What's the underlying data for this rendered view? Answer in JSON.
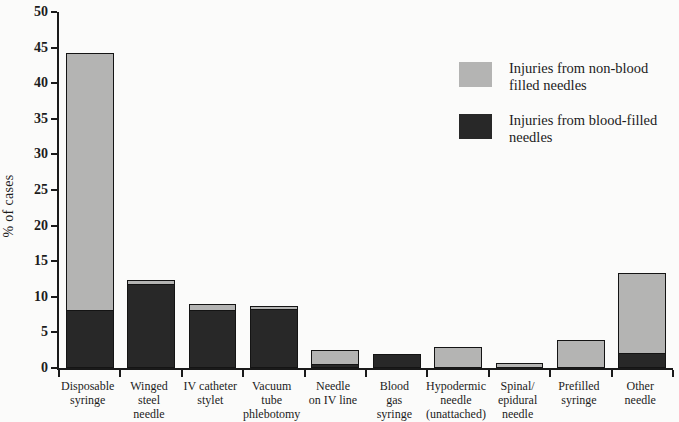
{
  "figure": {
    "background": "#fbfbfa",
    "axis_color": "#1a1a1a",
    "text_color": "#1c1c1c"
  },
  "chart_data": {
    "type": "bar",
    "stacked": true,
    "title": "",
    "xlabel": "",
    "ylabel": "% of cases",
    "ylim": [
      0,
      50
    ],
    "yticks": [
      0,
      5,
      10,
      15,
      20,
      25,
      30,
      35,
      40,
      45,
      50
    ],
    "grid": false,
    "categories": [
      "Disposable\nsyringe",
      "Winged\nsteel\nneedle",
      "IV catheter\nstylet",
      "Vacuum\ntube\nphlebotomy",
      "Needle\non IV line",
      "Blood\ngas\nsyringe",
      "Hypodermic\nneedle\n(unattached)",
      "Spinal/\nepidural\nneedle",
      "Prefilled\nsyringe",
      "Other\nneedle"
    ],
    "series": [
      {
        "name": "Injuries from blood-filled\nneedles",
        "color": "#282828",
        "stack_position": "bottom",
        "values": [
          8.0,
          11.6,
          8.0,
          8.1,
          0.4,
          2.0,
          0,
          0,
          0,
          2.0
        ]
      },
      {
        "name": "Injuries from non-blood\nfilled needles",
        "color": "#b4b4b3",
        "stack_position": "top",
        "values": [
          36.2,
          0.7,
          1.0,
          0.6,
          2.1,
          0,
          2.9,
          0.7,
          4.0,
          11.4
        ]
      }
    ],
    "totals": [
      44.2,
      12.3,
      9.0,
      8.7,
      2.5,
      2.0,
      2.9,
      0.7,
      4.0,
      13.4
    ],
    "legend": {
      "position": "upper-right",
      "display_order": [
        1,
        0
      ]
    }
  }
}
